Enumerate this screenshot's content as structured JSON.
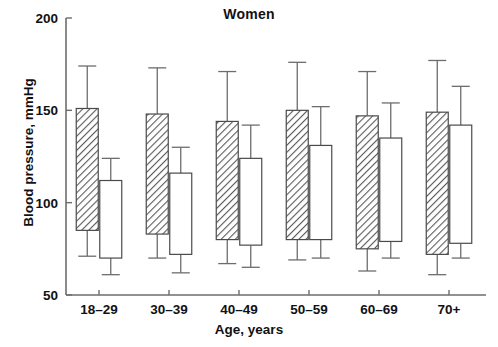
{
  "chart_data": {
    "type": "bar",
    "title": "Women",
    "xlabel": "Age, years",
    "ylabel": "Blood pressure, mmHg",
    "categories": [
      "18–29",
      "30–39",
      "40–49",
      "50–59",
      "60–69",
      "70+"
    ],
    "ylim": [
      50,
      200
    ],
    "yticks": [
      50,
      100,
      150,
      200
    ],
    "ytick_labels": [
      "50",
      "100",
      "150",
      "200"
    ],
    "grid": false,
    "legend": "none",
    "note": "Floating bars: each bar spans from diastolic-like low value to systolic-like high value, with whiskers marking the outer range.",
    "series": [
      {
        "name": "Systolic blood pressure",
        "fill": "hatched",
        "bar_low": [
          85,
          83,
          80,
          80,
          75,
          72
        ],
        "bar_high": [
          151,
          148,
          144,
          150,
          147,
          149
        ],
        "whisker_low": [
          71,
          70,
          67,
          69,
          63,
          61
        ],
        "whisker_high": [
          174,
          173,
          171,
          176,
          171,
          177
        ]
      },
      {
        "name": "Diastolic blood pressure",
        "fill": "open",
        "bar_low": [
          70,
          72,
          77,
          80,
          79,
          78
        ],
        "bar_high": [
          112,
          116,
          124,
          131,
          135,
          142
        ],
        "whisker_low": [
          61,
          62,
          65,
          70,
          70,
          70
        ],
        "whisker_high": [
          124,
          130,
          142,
          152,
          154,
          163
        ]
      }
    ],
    "colors": {
      "axis": "#6d6d6d",
      "bar_outline": "#4a4a4a",
      "hatch": "#555555",
      "open_fill": "#ffffff",
      "text": "#111111"
    }
  }
}
